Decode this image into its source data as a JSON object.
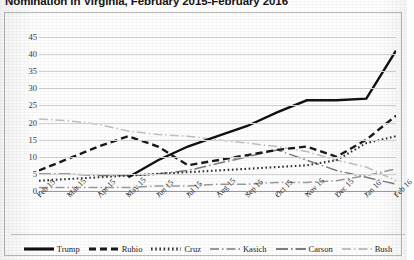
{
  "title": "Nomination in Virginia, February 2015-February 2016",
  "legend": {
    "position": "bottom",
    "items": [
      {
        "label": "Trump",
        "style": "solid",
        "color": "#111111"
      },
      {
        "label": "Rubio",
        "style": "dashed",
        "color": "#1a1a1a"
      },
      {
        "label": "Cruz",
        "style": "dotted",
        "color": "#333333"
      },
      {
        "label": "Kasich",
        "style": "dashdot",
        "color": "#9a9a9a"
      },
      {
        "label": "Carson",
        "style": "longdashdot",
        "color": "#7d7d7d"
      },
      {
        "label": "Bush",
        "style": "dashdot",
        "color": "#c0c0c0"
      }
    ]
  },
  "chart_data": {
    "type": "line",
    "title": "Nomination in Virginia, February 2015-February 2016",
    "xlabel": "",
    "ylabel": "",
    "ylim": [
      0,
      45
    ],
    "ytick_step": 5,
    "yticks": [
      45,
      40,
      35,
      30,
      25,
      20,
      15,
      10,
      5,
      0
    ],
    "grid": true,
    "categories": [
      "Feb 15",
      "Mar 15",
      "Apr 15",
      "May 15",
      "Jun 15",
      "Jul 15",
      "Aug 15",
      "Sep 15",
      "Oct 15",
      "Nov 15",
      "Dec 15",
      "Jan 16",
      "Feb 16"
    ],
    "series": [
      {
        "name": "Trump",
        "values": [
          null,
          null,
          null,
          4,
          9,
          13,
          16,
          19,
          23,
          26.5,
          26.5,
          27,
          41
        ]
      },
      {
        "name": "Rubio",
        "values": [
          6,
          9.5,
          13,
          16,
          13,
          7.5,
          9,
          10.5,
          12,
          13,
          10,
          15,
          22
        ]
      },
      {
        "name": "Cruz",
        "values": [
          3,
          3.5,
          4,
          4.5,
          5,
          5.5,
          6,
          6.5,
          7,
          7.5,
          9,
          14,
          16
        ]
      },
      {
        "name": "Kasich",
        "values": [
          1,
          1,
          1,
          1,
          1.5,
          1.5,
          2,
          2,
          2.5,
          2.5,
          3,
          4.5,
          6.5
        ]
      },
      {
        "name": "Carson",
        "values": [
          5,
          5,
          4.5,
          4.5,
          5,
          6,
          8,
          10,
          12,
          9,
          6,
          4,
          2
        ]
      },
      {
        "name": "Bush",
        "values": [
          21,
          20.5,
          19.5,
          17.5,
          16.5,
          16,
          15,
          14,
          13,
          11.5,
          9,
          7,
          3
        ]
      }
    ]
  }
}
